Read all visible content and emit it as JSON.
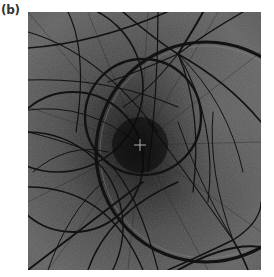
{
  "panel": {
    "label": "(b)"
  },
  "figure": {
    "background_color": "#555555",
    "band_color": "#141414",
    "center_marker": {
      "x": 112,
      "y": 133,
      "symbol": "cross",
      "color": "#cfcfcf"
    }
  }
}
